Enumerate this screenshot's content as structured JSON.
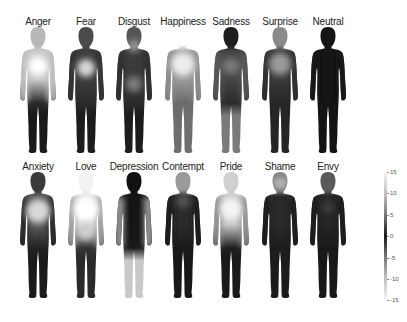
{
  "figure": {
    "rows": [
      [
        {
          "label": "Anger",
          "base": "#2a2a2a",
          "head": "#b8b8b8",
          "torso_upper": "#c8c8c8",
          "arms": "#bdbdbd",
          "hot": [
            {
              "cx": 22,
              "cy": 40,
              "r": 10,
              "c": "#ffffff"
            }
          ],
          "legs": "#1a1a1a"
        },
        {
          "label": "Fear",
          "base": "#2b2b2b",
          "head": "#4a4a4a",
          "torso_upper": "#3c3c3c",
          "arms": "#333333",
          "hot": [
            {
              "cx": 22,
              "cy": 42,
              "r": 9,
              "c": "#d8d8d8"
            }
          ],
          "legs": "#1c1c1c"
        },
        {
          "label": "Disgust",
          "base": "#2b2b2b",
          "head": "#555555",
          "torso_upper": "#3a3a3a",
          "arms": "#2e2e2e",
          "hot": [
            {
              "cx": 22,
              "cy": 20,
              "r": 6,
              "c": "#9a9a9a"
            },
            {
              "cx": 22,
              "cy": 58,
              "r": 8,
              "c": "#7a7a7a"
            }
          ],
          "legs": "#1c1c1c"
        },
        {
          "label": "Happiness",
          "base": "#6b6b6b",
          "head": "#ffffff",
          "torso_upper": "#9a9a9a",
          "arms": "#8a8a8a",
          "hot": [
            {
              "cx": 22,
              "cy": 38,
              "r": 12,
              "c": "#ececec"
            }
          ],
          "legs": "#6e6e6e"
        },
        {
          "label": "Sadness",
          "base": "#2a2a2a",
          "head": "#1e1e1e",
          "torso_upper": "#444444",
          "arms": "#5a5a5a",
          "hot": [
            {
              "cx": 22,
              "cy": 40,
              "r": 9,
              "c": "#777777"
            }
          ],
          "legs": "#7a7a7a"
        },
        {
          "label": "Surprise",
          "base": "#262626",
          "head": "#8a8a8a",
          "torso_upper": "#3a3a3a",
          "arms": "#2e2e2e",
          "hot": [
            {
              "cx": 22,
              "cy": 38,
              "r": 11,
              "c": "#9a9a9a"
            }
          ],
          "legs": "#252525"
        },
        {
          "label": "Neutral",
          "base": "#141414",
          "head": "#141414",
          "torso_upper": "#161616",
          "arms": "#161616",
          "hot": [],
          "legs": "#141414"
        }
      ],
      [
        {
          "label": "Anxiety",
          "base": "#222222",
          "head": "#3a3a3a",
          "torso_upper": "#5a5a5a",
          "arms": "#252525",
          "hot": [
            {
              "cx": 22,
              "cy": 40,
              "r": 12,
              "c": "#d8d8d8"
            }
          ],
          "legs": "#1a1a1a"
        },
        {
          "label": "Love",
          "base": "#333333",
          "head": "#f2f2f2",
          "torso_upper": "#dcdcdc",
          "arms": "#9a9a9a",
          "hot": [
            {
              "cx": 22,
              "cy": 38,
              "r": 13,
              "c": "#ffffff"
            },
            {
              "cx": 22,
              "cy": 60,
              "r": 9,
              "c": "#d0d0d0"
            }
          ],
          "legs": "#2a2a2a"
        },
        {
          "label": "Depression",
          "base": "#1a1a1a",
          "head": "#121212",
          "torso_upper": "#151515",
          "arms": "#a0a0a0",
          "hot": [],
          "legs": "#c8c8c8"
        },
        {
          "label": "Contempt",
          "base": "#1a1a1a",
          "head": "#9a9a9a",
          "torso_upper": "#2a2a2a",
          "arms": "#1c1c1c",
          "hot": [
            {
              "cx": 22,
              "cy": 30,
              "r": 7,
              "c": "#555555"
            }
          ],
          "legs": "#181818"
        },
        {
          "label": "Pride",
          "base": "#1e1e1e",
          "head": "#d0d0d0",
          "torso_upper": "#c8c8c8",
          "arms": "#8a8a8a",
          "hot": [
            {
              "cx": 22,
              "cy": 38,
              "r": 11,
              "c": "#f4f4f4"
            }
          ],
          "legs": "#1a1a1a"
        },
        {
          "label": "Shame",
          "base": "#1e1e1e",
          "head": "#8a8a8a",
          "torso_upper": "#2a2a2a",
          "arms": "#1c1c1c",
          "hot": [
            {
              "cx": 20,
              "cy": 12,
              "r": 3,
              "c": "#dddddd"
            },
            {
              "cx": 25,
              "cy": 12,
              "r": 3,
              "c": "#dddddd"
            }
          ],
          "legs": "#1c1c1c"
        },
        {
          "label": "Envy",
          "base": "#1a1a1a",
          "head": "#5a5a5a",
          "torso_upper": "#262626",
          "arms": "#1a1a1a",
          "hot": [
            {
              "cx": 22,
              "cy": 36,
              "r": 6,
              "c": "#3c3c3c"
            }
          ],
          "legs": "#181818"
        }
      ]
    ]
  },
  "colorbar": {
    "ticks": [
      "15",
      "10",
      "5",
      "0",
      "-5",
      "-10",
      "-15"
    ],
    "min": -15,
    "max": 15
  }
}
